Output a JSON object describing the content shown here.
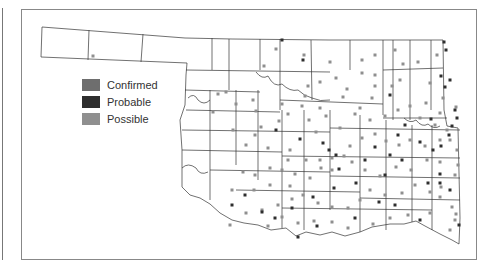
{
  "legend": {
    "items": [
      {
        "label": "Confirmed",
        "color": "#6e6e6e"
      },
      {
        "label": "Probable",
        "color": "#2e2e2e"
      },
      {
        "label": "Possible",
        "color": "#8f8f8f"
      }
    ]
  },
  "map": {
    "region": "Oklahoma",
    "outline_color": "#333333",
    "marker_size": 3,
    "markers": {
      "possible": [
        [
          93,
          56
        ],
        [
          218,
          94
        ],
        [
          226,
          92
        ],
        [
          253,
          100
        ],
        [
          264,
          66
        ],
        [
          276,
          49
        ],
        [
          304,
          55
        ],
        [
          330,
          62
        ],
        [
          336,
          78
        ],
        [
          347,
          89
        ],
        [
          362,
          73
        ],
        [
          362,
          60
        ],
        [
          375,
          55
        ],
        [
          375,
          75
        ],
        [
          375,
          86
        ],
        [
          372,
          98
        ],
        [
          395,
          50
        ],
        [
          403,
          64
        ],
        [
          400,
          80
        ],
        [
          392,
          86
        ],
        [
          418,
          62
        ],
        [
          437,
          55
        ],
        [
          430,
          83
        ],
        [
          443,
          98
        ],
        [
          426,
          103
        ],
        [
          440,
          113
        ],
        [
          456,
          107
        ],
        [
          320,
          82
        ],
        [
          326,
          116
        ],
        [
          343,
          97
        ],
        [
          308,
          86
        ],
        [
          305,
          96
        ],
        [
          302,
          106
        ],
        [
          282,
          104
        ],
        [
          288,
          114
        ],
        [
          256,
          111
        ],
        [
          236,
          104
        ],
        [
          213,
          112
        ],
        [
          233,
          130
        ],
        [
          261,
          127
        ],
        [
          279,
          121
        ],
        [
          309,
          120
        ],
        [
          320,
          108
        ],
        [
          355,
          114
        ],
        [
          360,
          108
        ],
        [
          370,
          120
        ],
        [
          385,
          116
        ],
        [
          398,
          110
        ],
        [
          410,
          106
        ],
        [
          420,
          118
        ],
        [
          435,
          125
        ],
        [
          447,
          130
        ],
        [
          450,
          140
        ],
        [
          457,
          150
        ],
        [
          440,
          140
        ],
        [
          425,
          146
        ],
        [
          410,
          140
        ],
        [
          399,
          145
        ],
        [
          386,
          141
        ],
        [
          375,
          134
        ],
        [
          362,
          138
        ],
        [
          350,
          146
        ],
        [
          344,
          156
        ],
        [
          332,
          170
        ],
        [
          321,
          168
        ],
        [
          310,
          178
        ],
        [
          295,
          174
        ],
        [
          282,
          170
        ],
        [
          270,
          168
        ],
        [
          255,
          175
        ],
        [
          243,
          172
        ],
        [
          270,
          185
        ],
        [
          290,
          186
        ],
        [
          306,
          160
        ],
        [
          320,
          160
        ],
        [
          332,
          158
        ],
        [
          352,
          162
        ],
        [
          365,
          170
        ],
        [
          380,
          176
        ],
        [
          396,
          167
        ],
        [
          411,
          170
        ],
        [
          427,
          160
        ],
        [
          440,
          162
        ],
        [
          458,
          165
        ],
        [
          455,
          175
        ],
        [
          441,
          187
        ],
        [
          430,
          192
        ],
        [
          415,
          185
        ],
        [
          402,
          193
        ],
        [
          385,
          195
        ],
        [
          370,
          190
        ],
        [
          360,
          200
        ],
        [
          348,
          208
        ],
        [
          332,
          207
        ],
        [
          318,
          203
        ],
        [
          303,
          195
        ],
        [
          292,
          199
        ],
        [
          278,
          205
        ],
        [
          262,
          210
        ],
        [
          246,
          213
        ],
        [
          230,
          225
        ],
        [
          288,
          160
        ],
        [
          268,
          148
        ],
        [
          440,
          197
        ],
        [
          452,
          207
        ],
        [
          456,
          214
        ],
        [
          455,
          220
        ],
        [
          450,
          230
        ],
        [
          430,
          213
        ],
        [
          408,
          215
        ],
        [
          390,
          218
        ],
        [
          373,
          224
        ],
        [
          348,
          228
        ],
        [
          332,
          222
        ],
        [
          314,
          221
        ],
        [
          298,
          223
        ],
        [
          282,
          217
        ],
        [
          268,
          226
        ],
        [
          254,
          190
        ],
        [
          232,
          190
        ],
        [
          246,
          145
        ],
        [
          316,
          132
        ],
        [
          340,
          128
        ],
        [
          255,
          135
        ],
        [
          290,
          150
        ]
      ],
      "probable": [
        [
          282,
          40
        ],
        [
          303,
          60
        ],
        [
          390,
          95
        ],
        [
          444,
          42
        ],
        [
          446,
          50
        ],
        [
          441,
          76
        ],
        [
          445,
          87
        ],
        [
          450,
          80
        ],
        [
          431,
          119
        ],
        [
          457,
          118
        ],
        [
          452,
          126
        ],
        [
          449,
          135
        ],
        [
          441,
          146
        ],
        [
          433,
          150
        ],
        [
          420,
          142
        ],
        [
          405,
          125
        ],
        [
          398,
          135
        ],
        [
          390,
          155
        ],
        [
          402,
          160
        ],
        [
          365,
          160
        ],
        [
          356,
          183
        ],
        [
          334,
          188
        ],
        [
          313,
          197
        ],
        [
          292,
          208
        ],
        [
          262,
          212
        ],
        [
          232,
          205
        ],
        [
          245,
          195
        ],
        [
          339,
          169
        ],
        [
          385,
          175
        ],
        [
          428,
          183
        ],
        [
          440,
          183
        ],
        [
          450,
          190
        ],
        [
          459,
          225
        ],
        [
          379,
          202
        ],
        [
          395,
          205
        ],
        [
          420,
          220
        ],
        [
          355,
          218
        ],
        [
          317,
          226
        ],
        [
          298,
          237
        ],
        [
          275,
          218
        ],
        [
          323,
          143
        ],
        [
          329,
          150
        ],
        [
          300,
          139
        ],
        [
          276,
          130
        ],
        [
          336,
          155
        ],
        [
          375,
          147
        ],
        [
          455,
          110
        ],
        [
          440,
          174
        ]
      ],
      "confirmed": []
    }
  }
}
